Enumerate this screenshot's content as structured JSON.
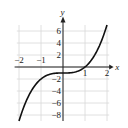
{
  "chart_data": {
    "type": "line",
    "title": "",
    "xlabel": "x",
    "ylabel": "y",
    "xlim": [
      -2.2,
      2.3
    ],
    "ylim": [
      -9,
      7.5
    ],
    "grid": true,
    "x_ticks": [
      -2,
      -1,
      1,
      2
    ],
    "x_tick_labels": [
      "−2",
      "−1",
      "1",
      "2"
    ],
    "y_ticks": [
      -8,
      -6,
      -4,
      -2,
      2,
      4,
      6
    ],
    "y_tick_labels": [
      "−8",
      "−6",
      "−4",
      "−2",
      "2",
      "4",
      "6"
    ],
    "series": [
      {
        "name": "y = x^3 - 1",
        "x": [
          -2,
          -1.5,
          -1,
          -0.5,
          0,
          0.5,
          1,
          1.5,
          2
        ],
        "y": [
          -9,
          -4.375,
          -2,
          -1.125,
          -1,
          -0.875,
          0,
          2.375,
          7
        ]
      }
    ],
    "colors": {
      "curve": "#111111",
      "grid": "#d8d8d8",
      "axis": "#222222"
    }
  }
}
